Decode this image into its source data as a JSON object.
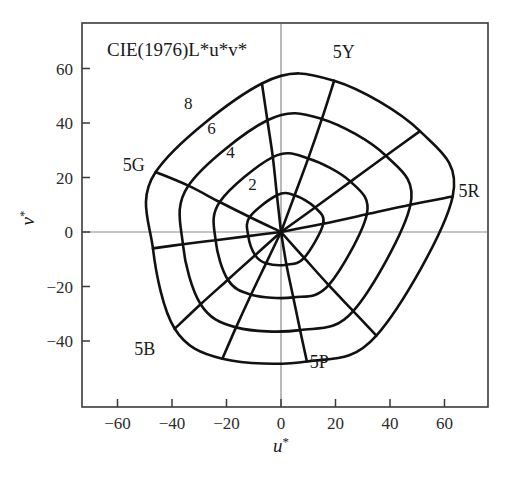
{
  "chart_data": {
    "type": "line",
    "title": "CIE(1976)L*u*v*",
    "xlabel": "u*",
    "ylabel": "v*",
    "xlabel_base": "u",
    "ylabel_base": "v",
    "star": "*",
    "xlim": [
      -75,
      75
    ],
    "ylim": [
      -52,
      72
    ],
    "xticks": [
      -60,
      -40,
      -20,
      0,
      20,
      40,
      60
    ],
    "yticks": [
      60,
      40,
      20,
      0,
      -20,
      -40
    ],
    "xtick_labels": [
      "−60",
      "−40",
      "−20",
      "0",
      "20",
      "40",
      "60"
    ],
    "ytick_labels": [
      "60",
      "40",
      "20",
      "0",
      "−20",
      "−40"
    ],
    "grid": false,
    "legend": "none",
    "origin": [
      0,
      0
    ],
    "chroma_labels": [
      {
        "text": "2",
        "u": -10.5,
        "v": 15.5
      },
      {
        "text": "4",
        "u": -18.5,
        "v": 27.0
      },
      {
        "text": "6",
        "u": -25.5,
        "v": 36.0
      },
      {
        "text": "8",
        "u": -34.0,
        "v": 45.0
      }
    ],
    "hue_labels": [
      {
        "text": "5Y",
        "u": 23.0,
        "v": 64.0
      },
      {
        "text": "5R",
        "u": 69.0,
        "v": 13.0
      },
      {
        "text": "5G",
        "u": -54.0,
        "v": 22.5
      },
      {
        "text": "5B",
        "u": -50.0,
        "v": -45.0
      },
      {
        "text": "5P",
        "u": 14.0,
        "v": -50.0
      }
    ],
    "hue_lines": [
      {
        "name": "5Y",
        "u": [
          0,
          5.0,
          10.0,
          15.0,
          19.5
        ],
        "v": [
          0,
          13.5,
          27.0,
          41.5,
          55.5
        ]
      },
      {
        "name": "5GY",
        "u": [
          0,
          -1.5,
          -3.0,
          -5.0,
          -7.0
        ],
        "v": [
          0,
          13.5,
          27.5,
          41.0,
          54.5
        ]
      },
      {
        "name": "5G",
        "u": [
          0,
          -11.5,
          -22.5,
          -34.0,
          -46.0
        ],
        "v": [
          0,
          5.5,
          11.0,
          17.0,
          22.0
        ]
      },
      {
        "name": "5BG",
        "u": [
          0,
          -12.0,
          -24.0,
          -36.0,
          -47.0
        ],
        "v": [
          0,
          -1.5,
          -3.0,
          -4.5,
          -6.0
        ]
      },
      {
        "name": "5B",
        "u": [
          0,
          -9.5,
          -19.5,
          -29.5,
          -39.0
        ],
        "v": [
          0,
          -8.5,
          -17.5,
          -26.5,
          -35.5
        ]
      },
      {
        "name": "5PB",
        "u": [
          0,
          -5.5,
          -11.0,
          -16.5,
          -21.5
        ],
        "v": [
          0,
          -11.5,
          -23.0,
          -35.0,
          -46.5
        ]
      },
      {
        "name": "5P",
        "u": [
          0,
          2.0,
          4.5,
          7.0,
          9.5
        ],
        "v": [
          0,
          -12.0,
          -24.0,
          -36.0,
          -47.5
        ]
      },
      {
        "name": "5RP",
        "u": [
          0,
          8.5,
          17.5,
          26.5,
          35.0
        ],
        "v": [
          0,
          -9.5,
          -19.5,
          -29.0,
          -38.0
        ]
      },
      {
        "name": "5R",
        "u": [
          0,
          15.5,
          31.5,
          47.5,
          63.0
        ],
        "v": [
          0,
          3.0,
          6.5,
          10.0,
          13.0
        ]
      },
      {
        "name": "5YR",
        "u": [
          0,
          12.5,
          25.5,
          38.5,
          51.0
        ],
        "v": [
          0,
          9.0,
          18.5,
          28.0,
          37.0
        ]
      }
    ],
    "chroma_contours": [
      {
        "chroma": 2,
        "u": [
          5.0,
          -1.5,
          -11.5,
          -12.0,
          -9.5,
          -5.5,
          2.0,
          8.5,
          15.5,
          12.5
        ],
        "v": [
          13.5,
          13.5,
          5.5,
          -1.5,
          -8.5,
          -11.5,
          -12.0,
          -9.5,
          3.0,
          9.0
        ]
      },
      {
        "chroma": 4,
        "u": [
          10.0,
          -3.0,
          -22.5,
          -24.0,
          -19.5,
          -11.0,
          4.5,
          17.5,
          31.5,
          25.5
        ],
        "v": [
          27.0,
          27.5,
          11.0,
          -3.0,
          -17.5,
          -23.0,
          -24.0,
          -19.5,
          6.5,
          18.5
        ]
      },
      {
        "chroma": 6,
        "u": [
          15.0,
          -5.0,
          -34.0,
          -36.0,
          -29.5,
          -16.5,
          7.0,
          26.5,
          47.5,
          38.5
        ],
        "v": [
          41.5,
          41.0,
          17.0,
          -4.5,
          -26.5,
          -35.0,
          -36.0,
          -29.0,
          10.0,
          28.0
        ]
      },
      {
        "chroma": 8,
        "u": [
          19.5,
          -7.0,
          -46.0,
          -47.0,
          -39.0,
          -21.5,
          9.5,
          35.0,
          63.0,
          51.0
        ],
        "v": [
          55.5,
          54.5,
          22.0,
          -6.0,
          -35.5,
          -46.5,
          -47.5,
          -38.0,
          13.0,
          37.0
        ]
      }
    ]
  },
  "axes": {
    "frame_visible": true,
    "zero_lines_visible": true
  }
}
